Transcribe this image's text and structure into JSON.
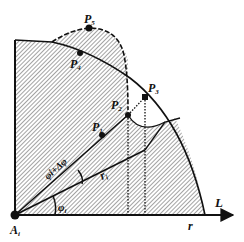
{
  "diagram": {
    "colors": {
      "ink": "#111111",
      "hatch": "#555555",
      "background": "#ffffff"
    },
    "origin": {
      "label": "A",
      "sub": "i",
      "x": 15,
      "y": 215
    },
    "axis": {
      "label": "L",
      "end_label": "r"
    },
    "points": [
      {
        "id": "P1",
        "label": "P",
        "sub": "1",
        "x": 102,
        "y": 135
      },
      {
        "id": "P2",
        "label": "P",
        "sub": "2",
        "x": 128,
        "y": 115
      },
      {
        "id": "P3",
        "label": "P",
        "sub": "3",
        "x": 145,
        "y": 97
      },
      {
        "id": "P4",
        "label": "P",
        "sub": "4",
        "x": 80,
        "y": 53
      },
      {
        "id": "P5",
        "label": "P",
        "sub": "5",
        "x": 89,
        "y": 28
      }
    ],
    "angles": {
      "phi_i": {
        "label": "φ",
        "sub": "i"
      },
      "phi_i_plus": {
        "label": "φi+Δφ"
      }
    },
    "ray_label": {
      "label": "r",
      "sub": "i"
    }
  }
}
